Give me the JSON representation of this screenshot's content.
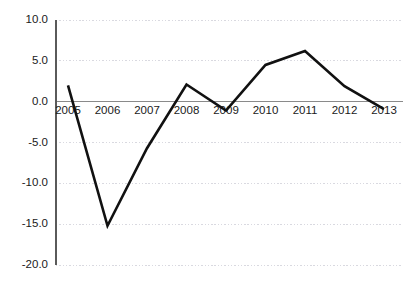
{
  "chart_data": {
    "type": "line",
    "title": "",
    "subtitle": "",
    "xlabel": "",
    "ylabel": "",
    "categories": [
      "2005",
      "2006",
      "2007",
      "2008",
      "2009",
      "2010",
      "2011",
      "2012",
      "2013"
    ],
    "values": [
      2.0,
      -15.2,
      -5.7,
      2.1,
      -1.1,
      4.5,
      6.2,
      1.9,
      -0.9
    ],
    "series": [
      {
        "name": "",
        "color": "#111111",
        "values": [
          2.0,
          -15.2,
          -5.7,
          2.1,
          -1.1,
          4.5,
          6.2,
          1.9,
          -0.9
        ]
      }
    ],
    "ylim": [
      -20.0,
      10.0
    ],
    "ytick_values": [
      10.0,
      5.0,
      0.0,
      -5.0,
      -10.0,
      -15.0,
      -20.0
    ],
    "ytick_labels": [
      "10.0",
      "5.0",
      "0.0",
      "-5.0",
      "-10.0",
      "-15.0",
      "-20.0"
    ],
    "xtick_labels": [
      "2005",
      "2006",
      "2007",
      "2008",
      "2009",
      "2010",
      "2011",
      "2012",
      "2013"
    ],
    "grid": true,
    "grid_axis": "y",
    "grid_color": "#d9d9e0",
    "legend": false,
    "legend_position": "none",
    "zero_line": true,
    "zero_line_color": "#8a8a8a",
    "axis_color": "#5a5a5a",
    "background": "#ffffff",
    "annotations": []
  },
  "layout": {
    "plot_left": 56,
    "plot_right": 403,
    "plot_top": 20,
    "plot_bottom": 265,
    "x_first": 68,
    "x_step": 39.5,
    "y_label_x": 48,
    "x_label_y": 106
  }
}
